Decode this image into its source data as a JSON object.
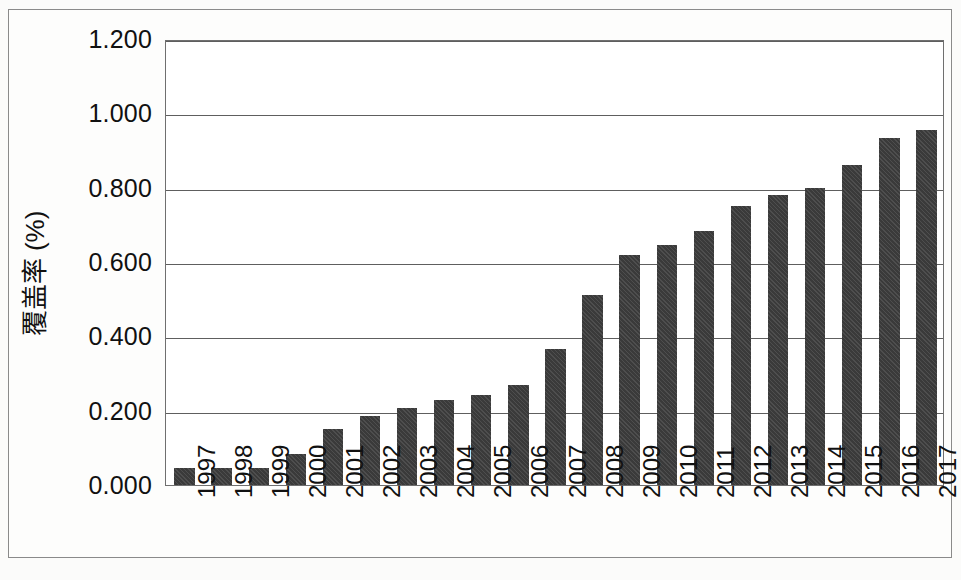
{
  "chart_data": {
    "type": "bar",
    "title": "",
    "xlabel": "",
    "ylabel": "覆盖率 (%)",
    "categories": [
      "1997",
      "1998",
      "1999",
      "2000",
      "2001",
      "2002",
      "2003",
      "2004",
      "2005",
      "2006",
      "2007",
      "2008",
      "2009",
      "2010",
      "2011",
      "2012",
      "2013",
      "2014",
      "2015",
      "2016",
      "2017"
    ],
    "values": [
      0.045,
      0.045,
      0.046,
      0.083,
      0.152,
      0.187,
      0.207,
      0.228,
      0.243,
      0.268,
      0.365,
      0.51,
      0.62,
      0.645,
      0.684,
      0.752,
      0.78,
      0.798,
      0.86,
      0.935,
      0.955
    ],
    "series": [
      {
        "name": "覆盖率 (%)",
        "values": [
          0.045,
          0.045,
          0.046,
          0.083,
          0.152,
          0.187,
          0.207,
          0.228,
          0.243,
          0.268,
          0.365,
          0.51,
          0.62,
          0.645,
          0.684,
          0.752,
          0.78,
          0.798,
          0.86,
          0.935,
          0.955
        ]
      }
    ],
    "ylim": [
      0.0,
      1.2
    ],
    "ytick_labels": [
      "0.000",
      "0.200",
      "0.400",
      "0.600",
      "0.800",
      "1.000",
      "1.200"
    ],
    "ytick_values": [
      0.0,
      0.2,
      0.4,
      0.6,
      0.8,
      1.0,
      1.2
    ],
    "grid": true,
    "grid_axis": "y",
    "legend": false,
    "legend_position": "none",
    "bar_color": "#3a3a3a",
    "plot_background": "#ffffff",
    "figure_background": "#fdfdfc",
    "axis_color": "#5e5e5e"
  },
  "axes": {
    "y_title": "覆盖率 (%)"
  }
}
